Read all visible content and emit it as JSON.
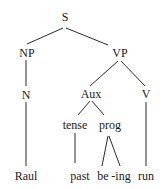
{
  "diagram": {
    "type": "syntax-tree",
    "nodes": {
      "S": "S",
      "NP": "NP",
      "VP": "VP",
      "N": "N",
      "Aux": "Aux",
      "V": "V",
      "tense": "tense",
      "prog": "prog",
      "Raul": "Raul",
      "past": "past",
      "be": "be",
      "ing": "-ing",
      "run": "run"
    },
    "edges": [
      [
        "S",
        "NP"
      ],
      [
        "S",
        "VP"
      ],
      [
        "NP",
        "N"
      ],
      [
        "N",
        "Raul"
      ],
      [
        "VP",
        "Aux"
      ],
      [
        "VP",
        "V"
      ],
      [
        "Aux",
        "tense"
      ],
      [
        "Aux",
        "prog"
      ],
      [
        "tense",
        "past"
      ],
      [
        "prog",
        "be"
      ],
      [
        "prog",
        "ing"
      ],
      [
        "V",
        "run"
      ]
    ],
    "colors": {
      "ink": "#1a1a1a",
      "background": "#ffffff"
    }
  }
}
